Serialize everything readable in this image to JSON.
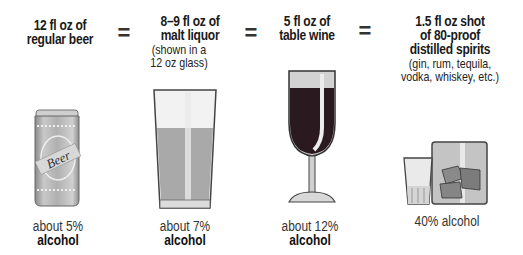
{
  "columns": [
    {
      "id": "beer",
      "heading": [
        "12 fl oz of",
        "regular beer"
      ],
      "note": [],
      "icon": "beer-can-icon",
      "can_label": "Beer",
      "caption_line1": "about 5%",
      "caption_line2": "alcohol"
    },
    {
      "id": "malt-liquor",
      "heading": [
        "8–9 fl oz of",
        "malt liquor"
      ],
      "note": [
        "(shown in a",
        "12 oz glass)"
      ],
      "icon": "pint-glass-icon",
      "caption_line1": "about 7%",
      "caption_line2": "alcohol"
    },
    {
      "id": "wine",
      "heading": [
        "5 fl oz of",
        "table wine"
      ],
      "note": [],
      "icon": "wine-glass-icon",
      "caption_line1": "about 12%",
      "caption_line2": "alcohol"
    },
    {
      "id": "spirits",
      "heading": [
        "1.5 fl oz shot",
        "of 80-proof",
        "distilled spirits"
      ],
      "note": [
        "(gin, rum, tequila,",
        "vodka, whiskey, etc.)"
      ],
      "icon": "shot-glass-icon",
      "caption_line1": "40% alcohol",
      "caption_line2": ""
    }
  ],
  "equals_sign": "=",
  "colors": {
    "wine": "#2a1a20",
    "glass_gray": "#b8b8b8",
    "beer_liquid": "#a9a9a9",
    "can_body": "#b5b5b5",
    "text": "#1a1a1a"
  }
}
